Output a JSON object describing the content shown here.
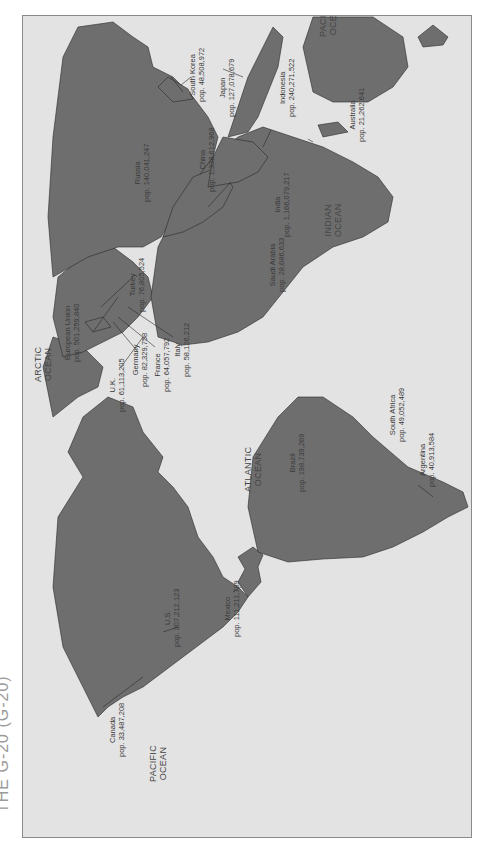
{
  "title": "THE G-20 (G-20)",
  "colors": {
    "land": "#6e6e6e",
    "water": "#e3e3e3",
    "border": "#2a2a2a",
    "frame": "#8a8a8a"
  },
  "oceans": {
    "pacific_west": [
      "PACIFIC",
      "OCEAN"
    ],
    "atlantic": [
      "ATLANTIC",
      "OCEAN"
    ],
    "arctic": [
      "ARCTIC",
      "OCEAN"
    ],
    "indian": [
      "INDIAN",
      "OCEAN"
    ],
    "pacific_east": [
      "PACIFIC",
      "OCEAN"
    ]
  },
  "countries": [
    {
      "name": "Canada",
      "pop": "pop. 33,487,208"
    },
    {
      "name": "U.S.",
      "pop": "pop. 307,212,123"
    },
    {
      "name": "Mexico",
      "pop": "pop. 111,211,789"
    },
    {
      "name": "Brazil",
      "pop": "pop. 198,739,269"
    },
    {
      "name": "Argentina",
      "pop": "pop. 40,913,584"
    },
    {
      "name": "U.K.",
      "pop": "pop. 61,113,205"
    },
    {
      "name": "Germany",
      "pop": "pop. 82,329,758"
    },
    {
      "name": "France",
      "pop": "pop. 64,057,792"
    },
    {
      "name": "Italy",
      "pop": "pop. 58,126,212"
    },
    {
      "name": "European Union",
      "pop": "pop. 501,259,840"
    },
    {
      "name": "Turkey",
      "pop": "pop. 76,805,524"
    },
    {
      "name": "Russia",
      "pop": "pop. 140,041,247"
    },
    {
      "name": "Saudi Arabia",
      "pop": "pop. 28,686,633"
    },
    {
      "name": "South Africa",
      "pop": "pop. 49,052,489"
    },
    {
      "name": "India",
      "pop": "pop. 1,166,079,217"
    },
    {
      "name": "China",
      "pop": "pop. 1,338,612,968"
    },
    {
      "name": "South Korea",
      "pop": "pop. 48,508,972"
    },
    {
      "name": "Japan",
      "pop": "pop. 127,078,679"
    },
    {
      "name": "Indonesia",
      "pop": "pop. 240,271,522"
    },
    {
      "name": "Australia",
      "pop": "pop. 21,262,641"
    }
  ]
}
